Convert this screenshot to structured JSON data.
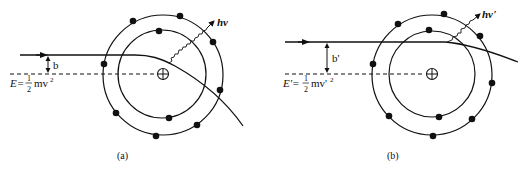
{
  "figure": {
    "panels": [
      {
        "id": "a",
        "caption": "(a)",
        "impact_parameter_label": "b",
        "energy_label": {
          "lhs": "E=",
          "frac_num": "1",
          "frac_den": "2",
          "rhs": "mv",
          "exp": "2"
        },
        "photon_label": "hv",
        "nucleus_symbol": "⊕"
      },
      {
        "id": "b",
        "caption": "(b)",
        "impact_parameter_label": "b'",
        "energy_label": {
          "lhs": "E'=",
          "frac_num": "1",
          "frac_den": "2",
          "rhs": "mv'",
          "exp": "2"
        },
        "photon_label": "hv'",
        "nucleus_symbol": "⊕"
      }
    ],
    "colors": {
      "ink": "#111111",
      "background": "#ffffff"
    }
  }
}
